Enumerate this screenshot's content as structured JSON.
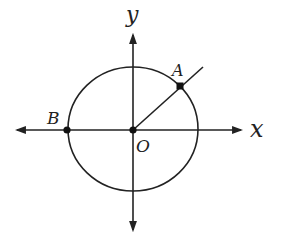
{
  "diagram": {
    "type": "unit-circle-coordinate-plane",
    "axes": {
      "x_label": "x",
      "y_label": "y"
    },
    "points": [
      {
        "name": "A",
        "label": "A",
        "description": "point on circle where ray from origin meets circle (first quadrant, ~45°)"
      },
      {
        "name": "B",
        "label": "B",
        "description": "point on circle on negative x-axis"
      },
      {
        "name": "O",
        "label": "O",
        "description": "origin, center of circle"
      }
    ],
    "circle": {
      "center": "O"
    },
    "ray": {
      "from": "O",
      "through": "A"
    },
    "colors": {
      "stroke": "#222222",
      "background": "#ffffff"
    }
  }
}
